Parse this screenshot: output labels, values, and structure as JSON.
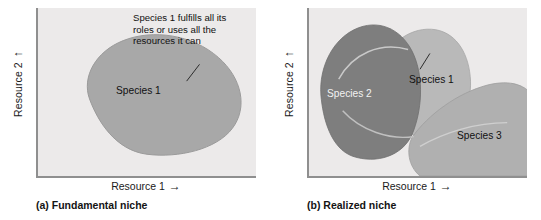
{
  "figure": {
    "panels": [
      {
        "id": "a",
        "caption": "(a) Fundamental niche",
        "axes": {
          "x_label": "Resource 1",
          "x_arrow": "→",
          "y_label": "Resource 2",
          "y_arrow": "↑"
        },
        "callout": "Species 1 fulfills all its\nroles or uses all the\nresources it can",
        "regions": [
          {
            "name": "Species 1",
            "label": "Species 1",
            "fill": "#a8a8a8"
          }
        ]
      },
      {
        "id": "b",
        "caption": "(b) Realized niche",
        "axes": {
          "x_label": "Resource 1",
          "x_arrow": "→",
          "y_label": "Resource 2",
          "y_arrow": "↑"
        },
        "callout": "Species 1 is limited in\nits roles or uses only\na subset of resources",
        "regions": [
          {
            "name": "Species 2",
            "label": "Species 2",
            "fill": "#7e7e7e"
          },
          {
            "name": "Species 1",
            "label": "Species 1",
            "fill": "#b9b9b9"
          },
          {
            "name": "Species 3",
            "label": "Species 3",
            "fill": "#b0b0b0"
          }
        ]
      }
    ],
    "colors": {
      "plot_background": "#eceaea",
      "axis_line": "#8f8f8f",
      "species1_fundamental": "#a8a8a8",
      "species1_realized": "#b9b9b9",
      "species2": "#7e7e7e",
      "species3": "#b0b0b0",
      "text": "#111111",
      "page_background": "#ffffff"
    }
  }
}
